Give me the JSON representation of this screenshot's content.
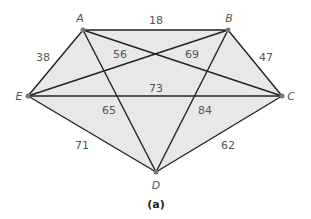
{
  "figure": {
    "caption": "(a)",
    "fill_color": "#e8e8e8",
    "edge_color": "#222222",
    "vertex_color": "#777777"
  },
  "vertices": [
    {
      "id": "A",
      "label": "A",
      "x": 83,
      "y": 30,
      "lx": 80,
      "ly": 22
    },
    {
      "id": "B",
      "label": "B",
      "x": 228,
      "y": 30,
      "lx": 229,
      "ly": 22
    },
    {
      "id": "C",
      "label": "C",
      "x": 282,
      "y": 96,
      "lx": 291,
      "ly": 100
    },
    {
      "id": "D",
      "label": "D",
      "x": 156,
      "y": 172,
      "lx": 156,
      "ly": 189
    },
    {
      "id": "E",
      "label": "E",
      "x": 28,
      "y": 96,
      "lx": 19,
      "ly": 100
    }
  ],
  "edges": [
    {
      "from": "A",
      "to": "B",
      "weight": "18",
      "lx": 156,
      "ly": 24
    },
    {
      "from": "A",
      "to": "E",
      "weight": "38",
      "lx": 43,
      "ly": 61
    },
    {
      "from": "B",
      "to": "C",
      "weight": "47",
      "lx": 266,
      "ly": 61
    },
    {
      "from": "E",
      "to": "D",
      "weight": "71",
      "lx": 82,
      "ly": 149
    },
    {
      "from": "C",
      "to": "D",
      "weight": "62",
      "lx": 228,
      "ly": 149
    },
    {
      "from": "A",
      "to": "C",
      "weight": "56",
      "lx": 120,
      "ly": 58
    },
    {
      "from": "E",
      "to": "B",
      "weight": "69",
      "lx": 192,
      "ly": 58
    },
    {
      "from": "E",
      "to": "C",
      "weight": "73",
      "lx": 156,
      "ly": 92
    },
    {
      "from": "A",
      "to": "D",
      "weight": "65",
      "lx": 109,
      "ly": 114
    },
    {
      "from": "B",
      "to": "D",
      "weight": "84",
      "lx": 205,
      "ly": 114
    }
  ]
}
